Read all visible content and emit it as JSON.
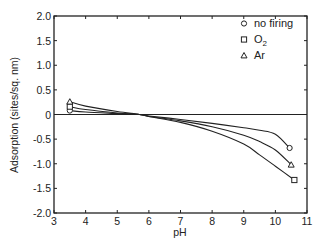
{
  "chart_data": {
    "type": "line",
    "title": "",
    "xlabel": "pH",
    "ylabel": "Adsorption (sites/sq. nm)",
    "xlim": [
      3,
      11
    ],
    "ylim": [
      -2.0,
      2.0
    ],
    "xticks": [
      3,
      4,
      5,
      6,
      7,
      8,
      9,
      10,
      11
    ],
    "yticks": [
      2.0,
      1.5,
      1.0,
      0.5,
      0,
      -0.5,
      -1.0,
      -1.5,
      -2.0
    ],
    "ytick_labels": [
      "2.0",
      "1.5",
      "1.0",
      "0.5",
      "0",
      "-0.5",
      "-1.0",
      "-1.5",
      "-2.0"
    ],
    "grid": false,
    "zero_line": true,
    "legend_position": "upper right",
    "series": [
      {
        "name": "no firing",
        "marker": "circle",
        "x": [
          3.5,
          4,
          5,
          5.7,
          6,
          7,
          8,
          9,
          9.5,
          10,
          10.45
        ],
        "values": [
          0.08,
          0.05,
          0.02,
          0,
          -0.03,
          -0.1,
          -0.18,
          -0.27,
          -0.32,
          -0.4,
          -0.68
        ],
        "marker_points": [
          [
            3.5,
            0.08
          ],
          [
            10.45,
            -0.68
          ]
        ]
      },
      {
        "name": "O2",
        "marker": "square",
        "x": [
          3.5,
          4,
          5,
          5.7,
          6,
          7,
          8,
          9,
          9.5,
          10,
          10.6
        ],
        "values": [
          0.16,
          0.1,
          0.03,
          0,
          -0.04,
          -0.16,
          -0.34,
          -0.6,
          -0.82,
          -1.05,
          -1.33
        ],
        "marker_points": [
          [
            3.5,
            0.16
          ],
          [
            10.6,
            -1.33
          ]
        ]
      },
      {
        "name": "Ar",
        "marker": "triangle",
        "x": [
          3.5,
          4,
          5,
          5.7,
          6,
          7,
          8,
          9,
          9.5,
          10,
          10.5
        ],
        "values": [
          0.26,
          0.17,
          0.06,
          0,
          -0.04,
          -0.13,
          -0.25,
          -0.42,
          -0.55,
          -0.72,
          -1.02
        ],
        "marker_points": [
          [
            3.5,
            0.26
          ],
          [
            10.5,
            -1.02
          ]
        ]
      }
    ]
  },
  "legend": {
    "items": [
      {
        "label": "no firing",
        "marker": "circle"
      },
      {
        "label": "O",
        "sub": "2",
        "marker": "square"
      },
      {
        "label": "Ar",
        "marker": "triangle"
      }
    ]
  },
  "colors": {
    "ink": "#222222",
    "background": "#ffffff"
  }
}
